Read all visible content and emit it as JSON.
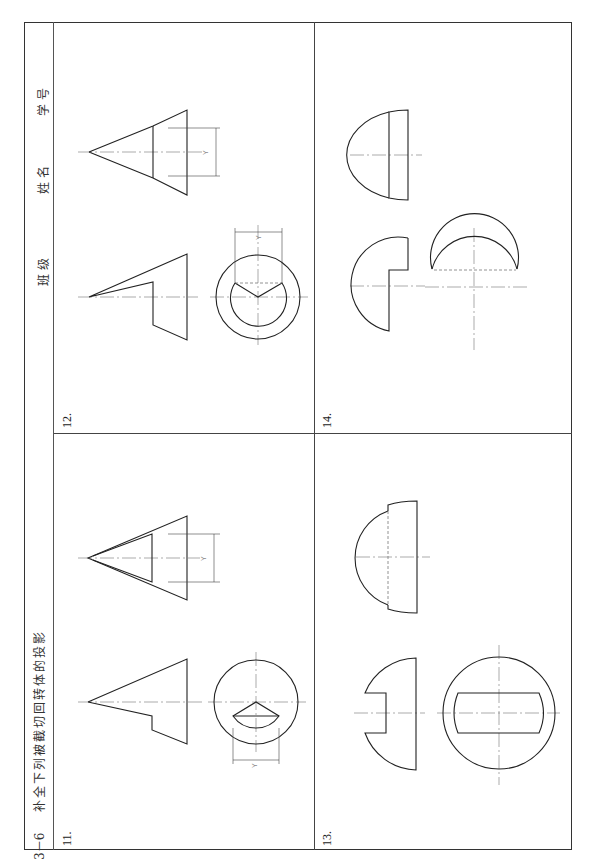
{
  "header": {
    "section": "3－6",
    "title": "补全下列被截切回转体的投影",
    "fields": [
      {
        "label": "班级"
      },
      {
        "label": "姓名"
      },
      {
        "label": "学号"
      }
    ]
  },
  "panels": [
    {
      "number": "11.",
      "dimension_labels": [
        "Y",
        "Y"
      ]
    },
    {
      "number": "12.",
      "dimension_labels": [
        "Y",
        "Y"
      ]
    },
    {
      "number": "13.",
      "dimension_labels": []
    },
    {
      "number": "14.",
      "dimension_labels": []
    }
  ],
  "colors": {
    "line": "#222222",
    "frame": "#333333",
    "centerline": "#888888",
    "background": "#ffffff"
  }
}
